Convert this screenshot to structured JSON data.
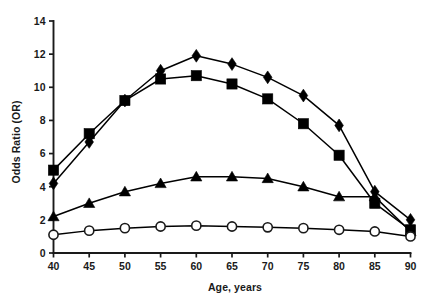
{
  "chart_data": {
    "type": "line",
    "title": "",
    "xlabel": "Age, years",
    "ylabel": "Odds Ratio (OR)",
    "xlim": [
      40,
      90
    ],
    "ylim": [
      0,
      14
    ],
    "xticks": [
      40,
      45,
      50,
      55,
      60,
      65,
      70,
      75,
      80,
      85,
      90
    ],
    "yticks": [
      0,
      2,
      4,
      6,
      8,
      10,
      12,
      14
    ],
    "grid": false,
    "legend": "none",
    "x": [
      40,
      45,
      50,
      55,
      60,
      65,
      70,
      75,
      80,
      85,
      90
    ],
    "series": [
      {
        "name": "filled-diamond-series",
        "marker": "filled-diamond",
        "color": "#000000",
        "values": [
          4.2,
          6.7,
          9.2,
          11.0,
          11.9,
          11.4,
          10.6,
          9.5,
          7.7,
          3.7,
          2.0
        ]
      },
      {
        "name": "filled-square-series",
        "marker": "filled-square",
        "color": "#000000",
        "values": [
          5.0,
          7.2,
          9.2,
          10.5,
          10.7,
          10.2,
          9.3,
          7.8,
          5.9,
          3.0,
          1.4
        ]
      },
      {
        "name": "filled-triangle-series",
        "marker": "filled-triangle",
        "color": "#000000",
        "values": [
          2.2,
          3.0,
          3.7,
          4.2,
          4.6,
          4.6,
          4.5,
          4.0,
          3.4,
          3.4,
          1.3
        ]
      },
      {
        "name": "open-circle-series",
        "marker": "open-circle",
        "color": "#000000",
        "values": [
          1.1,
          1.35,
          1.5,
          1.6,
          1.65,
          1.6,
          1.55,
          1.5,
          1.4,
          1.3,
          1.0
        ]
      }
    ]
  },
  "axis": {
    "ylabel_text": "Odds Ratio (OR)",
    "xlabel_text": "Age, years",
    "ytick_labels": [
      "0",
      "2",
      "4",
      "6",
      "8",
      "10",
      "12",
      "14"
    ],
    "xtick_labels": [
      "40",
      "45",
      "50",
      "55",
      "60",
      "65",
      "70",
      "75",
      "80",
      "85",
      "90"
    ]
  }
}
